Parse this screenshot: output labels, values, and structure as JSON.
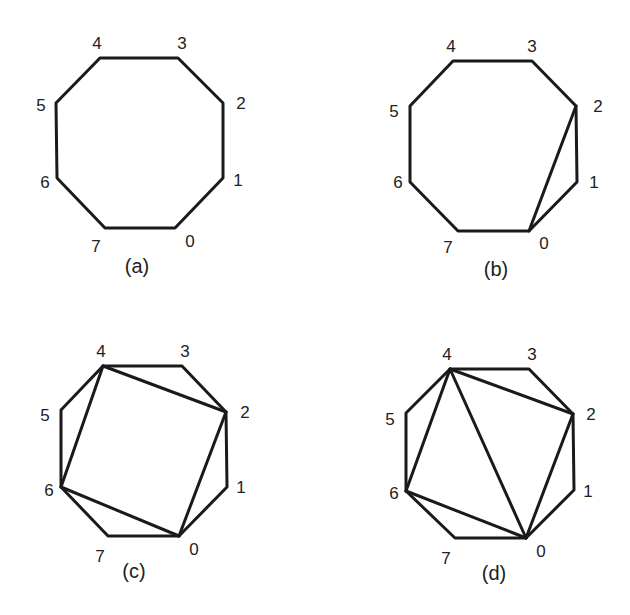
{
  "figure": {
    "colors": {
      "stroke": "#1a1a1a",
      "text": "#222222",
      "background": "#ffffff"
    },
    "panels": [
      {
        "id": "a",
        "caption": "(a)",
        "caption_pos": [
          137,
          273
        ],
        "vertices": [
          [
            175,
            228
          ],
          [
            223,
            178
          ],
          [
            223,
            103
          ],
          [
            178,
            58
          ],
          [
            100,
            58
          ],
          [
            56,
            103
          ],
          [
            57,
            178
          ],
          [
            105,
            228
          ]
        ],
        "labels": [
          "0",
          "1",
          "2",
          "3",
          "4",
          "5",
          "6",
          "7"
        ],
        "label_pos": [
          [
            190,
            247
          ],
          [
            238,
            186
          ],
          [
            241,
            109
          ],
          [
            182,
            49
          ],
          [
            97,
            49
          ],
          [
            41,
            111
          ],
          [
            45,
            188
          ],
          [
            96,
            252
          ]
        ],
        "diagonals": []
      },
      {
        "id": "b",
        "caption": "(b)",
        "caption_pos": [
          496,
          276
        ],
        "vertices": [
          [
            529,
            231
          ],
          [
            577,
            182
          ],
          [
            576,
            106
          ],
          [
            532,
            61
          ],
          [
            453,
            61
          ],
          [
            410,
            106
          ],
          [
            410,
            182
          ],
          [
            458,
            231
          ]
        ],
        "labels": [
          "0",
          "1",
          "2",
          "3",
          "4",
          "5",
          "6",
          "7"
        ],
        "label_pos": [
          [
            544,
            249
          ],
          [
            594,
            188
          ],
          [
            598,
            112
          ],
          [
            532,
            52
          ],
          [
            451,
            52
          ],
          [
            394,
            117
          ],
          [
            398,
            188
          ],
          [
            448,
            253
          ]
        ],
        "diagonals": [
          [
            0,
            2
          ]
        ]
      },
      {
        "id": "c",
        "caption": "(c)",
        "caption_pos": [
          134,
          578
        ],
        "vertices": [
          [
            179,
            536
          ],
          [
            227,
            487
          ],
          [
            226,
            412
          ],
          [
            182,
            366
          ],
          [
            103,
            366
          ],
          [
            61,
            410
          ],
          [
            61,
            487
          ],
          [
            108,
            536
          ]
        ],
        "labels": [
          "0",
          "1",
          "2",
          "3",
          "4",
          "5",
          "6",
          "7"
        ],
        "label_pos": [
          [
            194,
            555
          ],
          [
            241,
            493
          ],
          [
            245,
            418
          ],
          [
            185,
            357
          ],
          [
            101,
            357
          ],
          [
            45,
            421
          ],
          [
            49,
            496
          ],
          [
            100,
            562
          ]
        ],
        "diagonals": [
          [
            0,
            2
          ],
          [
            2,
            4
          ],
          [
            4,
            6
          ],
          [
            6,
            0
          ]
        ]
      },
      {
        "id": "d",
        "caption": "(d)",
        "caption_pos": [
          494,
          580
        ],
        "vertices": [
          [
            526,
            538
          ],
          [
            574,
            490
          ],
          [
            573,
            414
          ],
          [
            529,
            369
          ],
          [
            450,
            369
          ],
          [
            406,
            413
          ],
          [
            406,
            491
          ],
          [
            455,
            538
          ]
        ],
        "labels": [
          "0",
          "1",
          "2",
          "3",
          "4",
          "5",
          "6",
          "7"
        ],
        "label_pos": [
          [
            541,
            557
          ],
          [
            588,
            497
          ],
          [
            591,
            420
          ],
          [
            532,
            360
          ],
          [
            447,
            360
          ],
          [
            390,
            425
          ],
          [
            394,
            499
          ],
          [
            446,
            564
          ]
        ],
        "diagonals": [
          [
            0,
            2
          ],
          [
            2,
            4
          ],
          [
            4,
            6
          ],
          [
            6,
            0
          ],
          [
            0,
            4
          ]
        ]
      }
    ]
  }
}
